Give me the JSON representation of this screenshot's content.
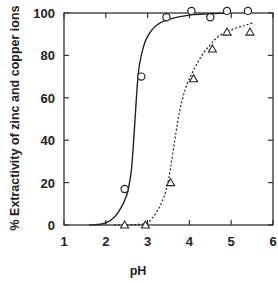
{
  "chart_data": {
    "type": "scatter",
    "title": "",
    "xlabel": "pH",
    "ylabel": "% Extractivity of zinc and copper ions",
    "xlim": [
      1,
      6
    ],
    "ylim": [
      0,
      100
    ],
    "x_ticks": [
      "1",
      "2",
      "3",
      "4",
      "5",
      "6"
    ],
    "y_ticks": [
      "0",
      "20",
      "40",
      "60",
      "80",
      "100"
    ],
    "grid": false,
    "legend": null,
    "series": [
      {
        "name": "circles",
        "marker": "circle",
        "line_style": "solid",
        "points": [
          {
            "x": 2.45,
            "y": 17
          },
          {
            "x": 2.85,
            "y": 70
          },
          {
            "x": 3.45,
            "y": 98
          },
          {
            "x": 4.05,
            "y": 101
          },
          {
            "x": 4.5,
            "y": 98
          },
          {
            "x": 4.9,
            "y": 101
          },
          {
            "x": 5.4,
            "y": 101
          }
        ],
        "curve": [
          [
            1.6,
            0
          ],
          [
            1.9,
            0.5
          ],
          [
            2.1,
            2
          ],
          [
            2.3,
            6
          ],
          [
            2.5,
            14
          ],
          [
            2.6,
            24
          ],
          [
            2.65,
            35
          ],
          [
            2.7,
            50
          ],
          [
            2.75,
            65
          ],
          [
            2.8,
            75
          ],
          [
            2.9,
            84
          ],
          [
            3.0,
            89
          ],
          [
            3.2,
            94
          ],
          [
            3.5,
            97
          ],
          [
            4.0,
            99
          ],
          [
            4.9,
            100
          ]
        ]
      },
      {
        "name": "triangles",
        "marker": "triangle",
        "line_style": "dotted",
        "points": [
          {
            "x": 2.45,
            "y": 0
          },
          {
            "x": 2.95,
            "y": 0
          },
          {
            "x": 3.55,
            "y": 20
          },
          {
            "x": 4.1,
            "y": 69
          },
          {
            "x": 4.55,
            "y": 83
          },
          {
            "x": 4.9,
            "y": 91
          },
          {
            "x": 5.45,
            "y": 91
          }
        ],
        "curve": [
          [
            2.2,
            0
          ],
          [
            2.9,
            0.5
          ],
          [
            3.1,
            3
          ],
          [
            3.3,
            9
          ],
          [
            3.45,
            17
          ],
          [
            3.55,
            27
          ],
          [
            3.65,
            40
          ],
          [
            3.75,
            52
          ],
          [
            3.9,
            64
          ],
          [
            4.1,
            73
          ],
          [
            4.3,
            80
          ],
          [
            4.5,
            85
          ],
          [
            4.7,
            89
          ],
          [
            5.0,
            92
          ],
          [
            5.3,
            94
          ],
          [
            5.55,
            95.5
          ]
        ]
      }
    ]
  },
  "labels": {
    "xlabel": "pH",
    "ylabel": "% Extractivity of zinc and copper ions",
    "x_ticks": [
      "1",
      "2",
      "3",
      "4",
      "5",
      "6"
    ],
    "y_ticks": [
      "0",
      "20",
      "40",
      "60",
      "80",
      "100"
    ]
  }
}
